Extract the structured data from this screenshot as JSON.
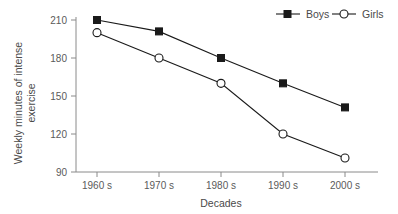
{
  "chart_data": {
    "type": "line",
    "title": "",
    "xlabel": "Decades",
    "ylabel": "Weekly minutes of intense exercise",
    "ylabel_line1": "Weekly minutes of intense",
    "ylabel_line2": "exercise",
    "categories": [
      "1960 s",
      "1970 s",
      "1980 s",
      "1990 s",
      "2000 s"
    ],
    "yticks": [
      90,
      120,
      150,
      180,
      210
    ],
    "ytick_labels": [
      "90",
      "120",
      "150",
      "180",
      "210"
    ],
    "ylim": [
      90,
      216
    ],
    "grid": false,
    "legend_position": "top-right",
    "series": [
      {
        "name": "Boys",
        "marker": "filled-square",
        "color": "#1a1a1a",
        "values": [
          210,
          201,
          180,
          160,
          141
        ]
      },
      {
        "name": "Girls",
        "marker": "open-circle",
        "color": "#1a1a1a",
        "values": [
          200,
          180,
          160,
          120,
          101
        ]
      }
    ]
  },
  "legend": {
    "items": [
      {
        "label": "Boys",
        "marker": "filled-square"
      },
      {
        "label": "Girls",
        "marker": "open-circle"
      }
    ]
  },
  "colors": {
    "ink": "#1a1a1a",
    "axis": "#8a8a8a",
    "text": "#4a4a4a",
    "background": "#ffffff"
  }
}
